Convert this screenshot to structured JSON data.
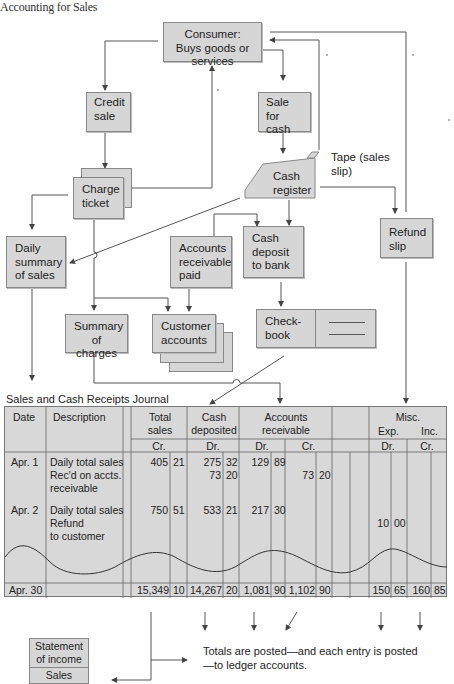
{
  "running_head": "Accounting for Sales",
  "diagram": {
    "boxes": {
      "consumer": "Consumer: Buys goods or services",
      "credit_sale": "Credit sale",
      "sale_for_cash": "Sale for cash",
      "charge_ticket": "Charge ticket",
      "cash_register": "Cash register",
      "tape_label": "Tape (sales slip)",
      "refund_slip": "Refund slip",
      "daily_summary": "Daily summary of sales",
      "accounts_receivable_paid": "Accounts receivable paid",
      "cash_deposit": "Cash deposit to bank",
      "summary_of_charges": "Summary of charges",
      "customer_accounts": "Customer accounts",
      "checkbook": "Check-book"
    }
  },
  "journal": {
    "title": "Sales and Cash Receipts Journal",
    "headers": {
      "date": "Date",
      "description": "Description",
      "total_sales": "Total sales",
      "total_sales_side": "Cr.",
      "cash_deposited": "Cash deposited",
      "cash_deposited_side": "Dr.",
      "accounts_receivable": "Accounts receivable",
      "ar_dr": "Dr.",
      "ar_cr": "Cr.",
      "misc": "Misc.",
      "misc_exp": "Exp.",
      "misc_inc": "Inc.",
      "misc_dr": "Dr.",
      "misc_cr": "Cr."
    },
    "rows": [
      {
        "date": "Apr. 1",
        "description": [
          "Daily total sales",
          "Rec'd on accts.",
          "receivable"
        ],
        "total_sales": {
          "d": "405",
          "c": "21"
        },
        "cash_deposited": [
          {
            "d": "275",
            "c": "32"
          },
          {
            "d": "73",
            "c": "20"
          }
        ],
        "ar_dr": {
          "d": "129",
          "c": "89"
        },
        "ar_cr": {
          "d": "73",
          "c": "20"
        }
      },
      {
        "date": "Apr. 2",
        "description": [
          "Daily total sales",
          "Refund",
          "to customer"
        ],
        "total_sales": {
          "d": "750",
          "c": "51"
        },
        "cash_deposited": [
          {
            "d": "533",
            "c": "21"
          }
        ],
        "ar_dr": {
          "d": "217",
          "c": "30"
        },
        "misc_exp_dr": {
          "d": "10",
          "c": "00"
        }
      }
    ],
    "totals": {
      "date": "Apr. 30",
      "total_sales": {
        "d": "15,349",
        "c": "10"
      },
      "cash_deposited": {
        "d": "14,267",
        "c": "20"
      },
      "ar_dr": {
        "d": "1,081",
        "c": "90"
      },
      "ar_cr": {
        "d": "1,102",
        "c": "90"
      },
      "misc_dr": {
        "d": "150",
        "c": "65"
      },
      "misc_cr": {
        "d": "160",
        "c": "85"
      }
    }
  },
  "statement": {
    "title": "Statement of income",
    "line": "Sales"
  },
  "posting_note": "Totals are posted—and each entry is posted—to ledger accounts.",
  "colors": {
    "box_fill": "#d6d6d6",
    "box_border": "#888888",
    "line": "#555555",
    "journal_fill": "#d8d8d8"
  }
}
